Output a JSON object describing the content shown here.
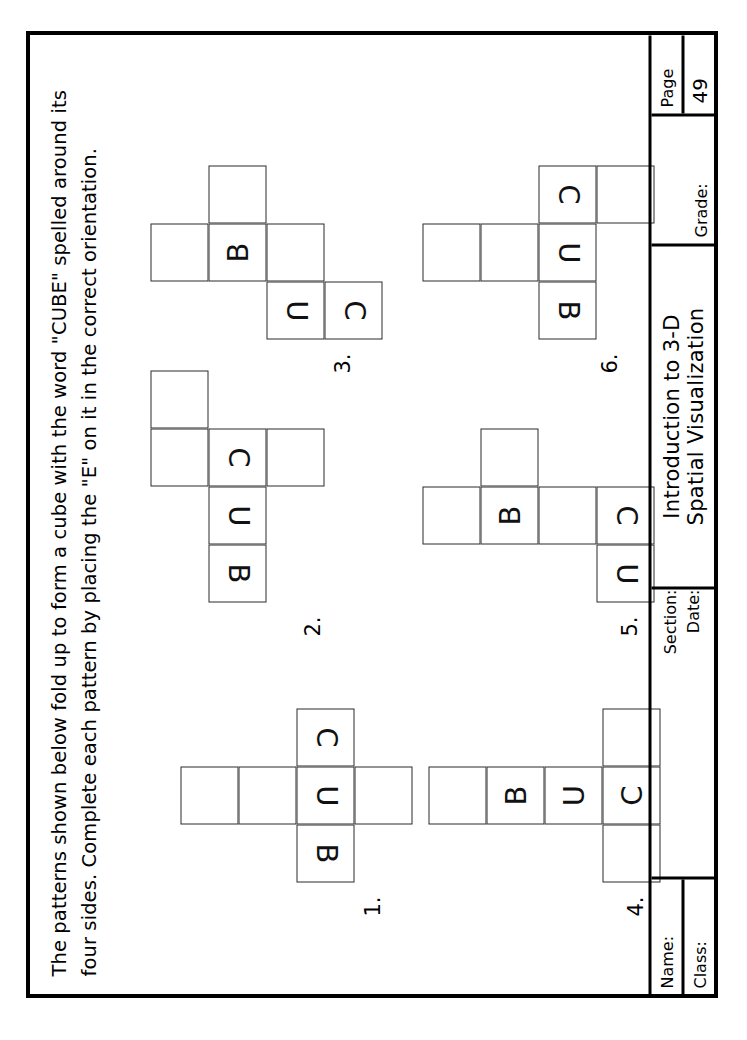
{
  "document": {
    "orientation": "landscape-rotated-90ccw",
    "instructions": "The patterns shown below fold up to form a cube with the word \"CUBE\" spelled around its\nfour sides.  Complete each pattern by placing the \"E\" on it in the correct orientation."
  },
  "title_block": {
    "name_label": "Name:",
    "class_label": "Class:",
    "section_label": "Section:",
    "date_label": "Date:",
    "title_line1": "Introduction to 3-D",
    "title_line2": "Spatial Visualization",
    "grade_label": "Grade:",
    "page_label": "Page",
    "page_number": "49"
  },
  "patterns": [
    {
      "number": "1.",
      "cells": [
        {
          "col": 1,
          "row": 0,
          "letter": "",
          "flipped": false
        },
        {
          "col": 1,
          "row": 1,
          "letter": "",
          "flipped": false
        },
        {
          "col": 0,
          "row": 2,
          "letter": "B",
          "flipped": true
        },
        {
          "col": 1,
          "row": 2,
          "letter": "U",
          "flipped": true
        },
        {
          "col": 2,
          "row": 2,
          "letter": "C",
          "flipped": true
        },
        {
          "col": 1,
          "row": 3,
          "letter": "",
          "flipped": false
        }
      ]
    },
    {
      "number": "2.",
      "cells": [
        {
          "col": 2,
          "row": 0,
          "letter": "",
          "flipped": false
        },
        {
          "col": 3,
          "row": 0,
          "letter": "",
          "flipped": false
        },
        {
          "col": 0,
          "row": 1,
          "letter": "B",
          "flipped": true
        },
        {
          "col": 1,
          "row": 1,
          "letter": "U",
          "flipped": true
        },
        {
          "col": 2,
          "row": 1,
          "letter": "C",
          "flipped": true
        },
        {
          "col": 2,
          "row": 2,
          "letter": "",
          "flipped": false
        }
      ]
    },
    {
      "number": "3.",
      "cells": [
        {
          "col": 1,
          "row": 0,
          "letter": "",
          "flipped": false
        },
        {
          "col": 1,
          "row": 1,
          "letter": "B",
          "flipped": false
        },
        {
          "col": 2,
          "row": 1,
          "letter": "",
          "flipped": false
        },
        {
          "col": 0,
          "row": 2,
          "letter": "U",
          "flipped": true
        },
        {
          "col": 1,
          "row": 2,
          "letter": "",
          "flipped": false
        },
        {
          "col": 0,
          "row": 3,
          "letter": "C",
          "flipped": true
        }
      ]
    },
    {
      "number": "4.",
      "cells": [
        {
          "col": 1,
          "row": 0,
          "letter": "",
          "flipped": false
        },
        {
          "col": 1,
          "row": 1,
          "letter": "B",
          "flipped": false
        },
        {
          "col": 1,
          "row": 2,
          "letter": "U",
          "flipped": false
        },
        {
          "col": 0,
          "row": 3,
          "letter": "",
          "flipped": false
        },
        {
          "col": 1,
          "row": 3,
          "letter": "C",
          "flipped": false
        },
        {
          "col": 2,
          "row": 3,
          "letter": "",
          "flipped": false
        }
      ]
    },
    {
      "number": "5.",
      "cells": [
        {
          "col": 1,
          "row": 0,
          "letter": "",
          "flipped": false
        },
        {
          "col": 1,
          "row": 1,
          "letter": "B",
          "flipped": false
        },
        {
          "col": 2,
          "row": 1,
          "letter": "",
          "flipped": false
        },
        {
          "col": 1,
          "row": 2,
          "letter": "",
          "flipped": false
        },
        {
          "col": 0,
          "row": 3,
          "letter": "U",
          "flipped": true
        },
        {
          "col": 1,
          "row": 3,
          "letter": "C",
          "flipped": true
        }
      ]
    },
    {
      "number": "6.",
      "cells": [
        {
          "col": 1,
          "row": 0,
          "letter": "",
          "flipped": false
        },
        {
          "col": 1,
          "row": 1,
          "letter": "",
          "flipped": false
        },
        {
          "col": 0,
          "row": 2,
          "letter": "B",
          "flipped": true
        },
        {
          "col": 1,
          "row": 2,
          "letter": "U",
          "flipped": true
        },
        {
          "col": 2,
          "row": 2,
          "letter": "C",
          "flipped": true
        },
        {
          "col": 2,
          "row": 3,
          "letter": "",
          "flipped": false
        }
      ]
    }
  ]
}
